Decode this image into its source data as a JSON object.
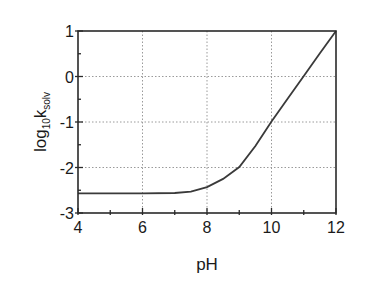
{
  "chart_data": {
    "type": "line",
    "title": "",
    "xlabel": "pH",
    "ylabel": "log10 k_solv",
    "ylabel_parts": {
      "base": "log",
      "sub1": "10",
      "main": "k",
      "sub2": "solv"
    },
    "xlim": [
      4,
      12
    ],
    "ylim": [
      -3,
      1
    ],
    "xticks": [
      4,
      6,
      8,
      10,
      12
    ],
    "xtick_labels": [
      "4",
      "6",
      "8",
      "10",
      "12"
    ],
    "yticks": [
      1,
      0,
      -1,
      -2,
      -3
    ],
    "ytick_labels": [
      "1",
      "0",
      "-1",
      "-2",
      "-3"
    ],
    "grid": true,
    "grid_style": "dotted",
    "legend": null,
    "series": [
      {
        "name": "log10 k_solv",
        "x": [
          4,
          5,
          6,
          7,
          7.5,
          8,
          8.5,
          9,
          9.5,
          10,
          10.5,
          11,
          11.5,
          12
        ],
        "y": [
          -2.57,
          -2.57,
          -2.57,
          -2.56,
          -2.53,
          -2.43,
          -2.25,
          -1.99,
          -1.53,
          -0.99,
          -0.49,
          0.01,
          0.51,
          1.0
        ]
      }
    ],
    "colors": {
      "line": "#3a3a3a",
      "frame": "#2a2a2a",
      "grid": "#9a9a9a"
    }
  }
}
